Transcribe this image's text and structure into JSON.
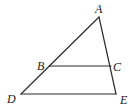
{
  "figure": {
    "type": "triangle-with-parallel-segment",
    "points": {
      "A": {
        "label": "A",
        "x": 99,
        "y": 17
      },
      "B": {
        "label": "B",
        "x": 49,
        "y": 66
      },
      "C": {
        "label": "C",
        "x": 111,
        "y": 66
      },
      "D": {
        "label": "D",
        "x": 21,
        "y": 94
      },
      "E": {
        "label": "E",
        "x": 116,
        "y": 94
      }
    },
    "segments": [
      "AD",
      "AE",
      "DE",
      "BC"
    ],
    "labels": {
      "A": "A",
      "B": "B",
      "C": "C",
      "D": "D",
      "E": "E"
    },
    "stroke_color": "#2a2a2a"
  }
}
